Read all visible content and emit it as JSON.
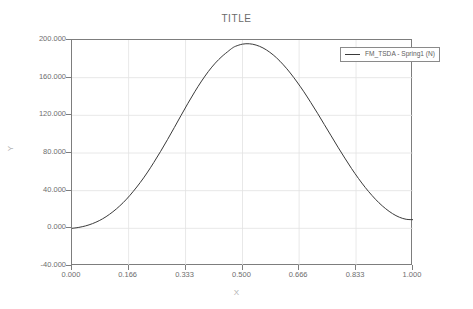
{
  "chart_data": {
    "type": "line",
    "title": "TITLE",
    "xlabel": "X",
    "ylabel": "Y",
    "xlim": [
      0.0,
      1.0
    ],
    "ylim": [
      -40.0,
      200.0
    ],
    "grid": true,
    "legend_position": "top-right",
    "x_ticks": [
      "0.000",
      "0.166",
      "0.333",
      "0.500",
      "0.666",
      "0.833",
      "1.000"
    ],
    "x_tick_values": [
      0.0,
      0.166,
      0.333,
      0.5,
      0.666,
      0.833,
      1.0
    ],
    "y_ticks": [
      "200.000",
      "160.000",
      "120.000",
      "80.000",
      "40.000",
      "0.000",
      "-40.000"
    ],
    "y_tick_values": [
      200.0,
      160.0,
      120.0,
      80.0,
      40.0,
      0.0,
      -40.0
    ],
    "series": [
      {
        "name": "FM_TSDA - Spring1 (N)",
        "color": "#3a3a3a",
        "x": [
          0.0,
          0.02,
          0.04,
          0.06,
          0.08,
          0.1,
          0.12,
          0.14,
          0.16,
          0.18,
          0.2,
          0.22,
          0.24,
          0.26,
          0.28,
          0.3,
          0.32,
          0.34,
          0.36,
          0.38,
          0.4,
          0.42,
          0.44,
          0.46,
          0.47,
          0.48,
          0.5,
          0.52,
          0.54,
          0.56,
          0.58,
          0.6,
          0.62,
          0.64,
          0.66,
          0.68,
          0.7,
          0.72,
          0.74,
          0.76,
          0.78,
          0.8,
          0.82,
          0.84,
          0.86,
          0.88,
          0.9,
          0.92,
          0.94,
          0.96,
          0.98,
          1.0
        ],
        "y": [
          0.0,
          1.0,
          2.6,
          5.0,
          8.2,
          12.4,
          17.6,
          23.8,
          31.0,
          39.4,
          48.6,
          58.8,
          70.0,
          81.8,
          94.2,
          107.0,
          120.0,
          132.8,
          145.0,
          156.4,
          166.6,
          175.4,
          182.6,
          188.6,
          191.4,
          193.4,
          195.6,
          196.0,
          194.6,
          191.6,
          187.0,
          181.0,
          173.6,
          165.0,
          155.4,
          145.0,
          133.8,
          122.2,
          110.2,
          98.2,
          86.2,
          74.6,
          63.4,
          53.0,
          43.4,
          34.8,
          27.2,
          20.8,
          15.6,
          11.8,
          9.6,
          9.2
        ]
      }
    ]
  },
  "legend": {
    "entries": [
      {
        "label": "FM_TSDA - Spring1 (N)"
      }
    ]
  }
}
